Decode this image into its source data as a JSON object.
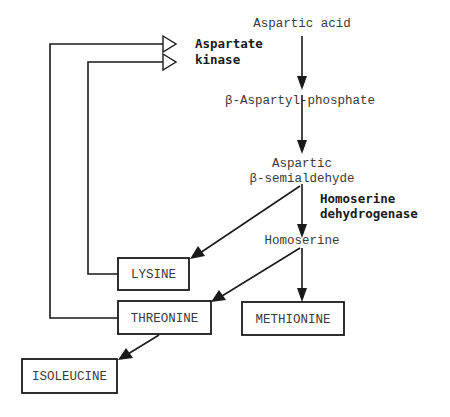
{
  "diagram": {
    "nodes": {
      "aspartic_acid": "Aspartic acid",
      "aspartyl_phosphate": "β-Aspartyl-phosphate",
      "semialdehyde_line1": "Aspartic",
      "semialdehyde_line2": "β-semialdehyde",
      "homoserine": "Homoserine",
      "lysine": "LYSINE",
      "threonine": "THREONINE",
      "methionine": "METHIONINE",
      "isoleucine": "ISOLEUCINE"
    },
    "enzymes": {
      "aspartate_kinase_line1": "Aspartate",
      "aspartate_kinase_line2": "kinase",
      "homoserine_dh_line1": "Homoserine",
      "homoserine_dh_line2": "dehydrogenase"
    },
    "edges": [
      {
        "from": "Aspartic acid",
        "to": "β-Aspartyl-phosphate",
        "type": "reaction"
      },
      {
        "from": "β-Aspartyl-phosphate",
        "to": "Aspartic β-semialdehyde",
        "type": "reaction"
      },
      {
        "from": "Aspartic β-semialdehyde",
        "to": "Homoserine",
        "type": "reaction",
        "enzyme": "Homoserine dehydrogenase"
      },
      {
        "from": "Aspartic β-semialdehyde",
        "to": "LYSINE",
        "type": "reaction"
      },
      {
        "from": "Homoserine",
        "to": "THREONINE",
        "type": "reaction"
      },
      {
        "from": "Homoserine",
        "to": "METHIONINE",
        "type": "reaction"
      },
      {
        "from": "THREONINE",
        "to": "ISOLEUCINE",
        "type": "reaction"
      },
      {
        "from": "THREONINE",
        "to": "Aspartate kinase",
        "type": "feedback-inhibition"
      },
      {
        "from": "LYSINE",
        "to": "Aspartate kinase",
        "type": "feedback-inhibition"
      }
    ],
    "colors": {
      "line": "#1a1a1a",
      "text": "#3a3a3a",
      "background": "#ffffff"
    }
  }
}
